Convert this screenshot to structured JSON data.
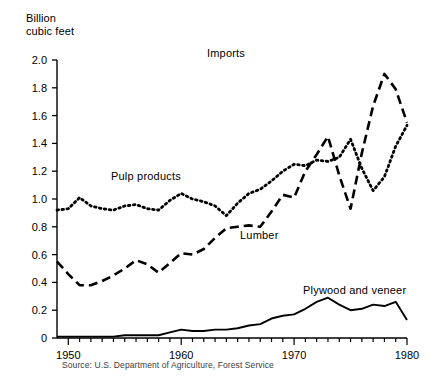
{
  "figure": {
    "axis_title": "Billion\ncubic feet",
    "title": "Imports",
    "source": "Source: U.S. Department of Agriculture, Forest Service",
    "labels": {
      "pulp": "Pulp products",
      "lumber": "Lumber",
      "plywood": "Plywood and veneer"
    }
  },
  "chart_data": {
    "type": "line",
    "title": "Imports",
    "subtitle": "",
    "xlabel": "",
    "ylabel": "Billion cubic feet",
    "xlim": [
      1949,
      1980
    ],
    "ylim": [
      0,
      2.0
    ],
    "ytick_labels": [
      "0",
      "0.2",
      "0.4",
      "0.6",
      "0.8",
      "1.0",
      "1.2",
      "1.4",
      "1.6",
      "1.8",
      "2.0"
    ],
    "yticks": [
      0,
      0.2,
      0.4,
      0.6,
      0.8,
      1.0,
      1.2,
      1.4,
      1.6,
      1.8,
      2.0
    ],
    "xtick_labels": [
      "1950",
      "1960",
      "1970",
      "1980"
    ],
    "xticks": [
      1950,
      1960,
      1970,
      1980
    ],
    "xminor_tick_interval": 1,
    "grid": false,
    "legend": "inline-annotations",
    "source": "Source: U.S. Department of Agriculture, Forest Service",
    "x": [
      1949,
      1950,
      1951,
      1952,
      1953,
      1954,
      1955,
      1956,
      1957,
      1958,
      1959,
      1960,
      1961,
      1962,
      1963,
      1964,
      1965,
      1966,
      1967,
      1968,
      1969,
      1970,
      1971,
      1972,
      1973,
      1974,
      1975,
      1976,
      1977,
      1978,
      1979,
      1980
    ],
    "series": [
      {
        "name": "Pulp products",
        "style": "dotted",
        "values": [
          0.92,
          0.93,
          1.01,
          0.95,
          0.93,
          0.92,
          0.95,
          0.96,
          0.93,
          0.92,
          0.99,
          1.04,
          1.0,
          0.98,
          0.95,
          0.88,
          0.97,
          1.04,
          1.07,
          1.13,
          1.2,
          1.25,
          1.24,
          1.28,
          1.27,
          1.3,
          1.43,
          1.22,
          1.06,
          1.16,
          1.38,
          1.53
        ],
        "values_note": "1976-77 dip, peak 1.45 at 1973"
      },
      {
        "name": "Lumber",
        "style": "dashed",
        "values": [
          0.55,
          0.46,
          0.38,
          0.38,
          0.41,
          0.45,
          0.5,
          0.56,
          0.53,
          0.47,
          0.54,
          0.61,
          0.6,
          0.64,
          0.72,
          0.79,
          0.8,
          0.81,
          0.8,
          0.91,
          1.03,
          1.01,
          1.2,
          1.32,
          1.45,
          1.17,
          0.93,
          1.33,
          1.67,
          1.9,
          1.79,
          1.55
        ],
        "values_note": "deep 1975 trough at 0.93, peak 1.90 in 1978"
      },
      {
        "name": "Plywood and veneer",
        "style": "solid",
        "values": [
          0.01,
          0.01,
          0.01,
          0.01,
          0.01,
          0.01,
          0.02,
          0.02,
          0.02,
          0.02,
          0.04,
          0.06,
          0.05,
          0.05,
          0.06,
          0.06,
          0.07,
          0.09,
          0.1,
          0.14,
          0.16,
          0.17,
          0.21,
          0.26,
          0.29,
          0.24,
          0.2,
          0.21,
          0.24,
          0.23,
          0.26,
          0.13
        ]
      }
    ]
  }
}
